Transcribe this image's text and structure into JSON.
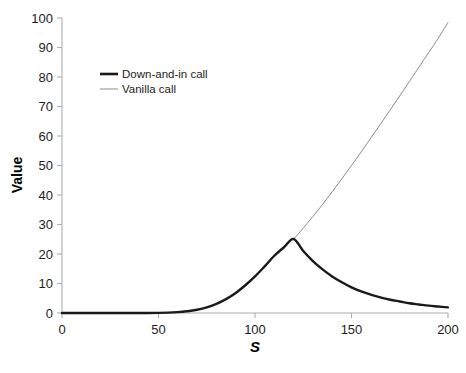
{
  "chart_data": {
    "type": "line",
    "title": "",
    "xlabel": "S",
    "ylabel": "Value",
    "xlim": [
      0,
      200
    ],
    "ylim": [
      0,
      100
    ],
    "xticks": [
      0,
      50,
      100,
      150,
      200
    ],
    "yticks": [
      0,
      10,
      20,
      30,
      40,
      50,
      60,
      70,
      80,
      90,
      100
    ],
    "xtick_labels": [
      "0",
      "50",
      "100",
      "150",
      "200"
    ],
    "ytick_labels": [
      "0",
      "10",
      "20",
      "30",
      "40",
      "50",
      "60",
      "70",
      "80",
      "90",
      "100"
    ],
    "grid": false,
    "legend_position": "upper-left-inside",
    "barrier_level": 120,
    "barrier_value": 25,
    "series": [
      {
        "name": "Down-and-in call",
        "color": "#1a1a1a",
        "line_width": 2.4,
        "x": [
          0,
          10,
          20,
          30,
          40,
          50,
          60,
          65,
          70,
          75,
          80,
          85,
          90,
          95,
          100,
          105,
          110,
          115,
          120,
          125,
          130,
          135,
          140,
          145,
          150,
          155,
          160,
          165,
          170,
          175,
          180,
          185,
          190,
          195,
          200
        ],
        "values": [
          0,
          0,
          0,
          0,
          0,
          0.05,
          0.3,
          0.6,
          1.1,
          1.9,
          3.1,
          4.7,
          6.8,
          9.4,
          12.4,
          15.8,
          19.4,
          22.3,
          25.1,
          21.0,
          17.6,
          14.8,
          12.4,
          10.4,
          8.7,
          7.3,
          6.2,
          5.3,
          4.5,
          3.9,
          3.3,
          2.9,
          2.5,
          2.2,
          1.9
        ]
      },
      {
        "name": "Vanilla call",
        "color": "#8c8c8c",
        "line_width": 1.0,
        "x": [
          0,
          10,
          20,
          30,
          40,
          50,
          60,
          65,
          70,
          75,
          80,
          85,
          90,
          95,
          100,
          105,
          110,
          115,
          120,
          125,
          130,
          135,
          140,
          145,
          150,
          155,
          160,
          165,
          170,
          175,
          180,
          185,
          190,
          195,
          200
        ],
        "values": [
          0,
          0,
          0,
          0,
          0,
          0.05,
          0.3,
          0.6,
          1.1,
          1.9,
          3.1,
          4.7,
          6.8,
          9.4,
          12.4,
          15.8,
          19.4,
          22.3,
          25.1,
          28.8,
          32.7,
          36.8,
          41.1,
          45.5,
          50.0,
          54.6,
          59.3,
          64.0,
          68.8,
          73.6,
          78.5,
          83.4,
          88.3,
          93.2,
          98.5
        ]
      }
    ],
    "legend": [
      {
        "label": "Down-and-in call",
        "color": "#1a1a1a",
        "line_width": 2.6
      },
      {
        "label": "Vanilla call",
        "color": "#8c8c8c",
        "line_width": 1.0
      }
    ],
    "axis_color": "#aeaeae"
  },
  "caption": {
    "text": ""
  }
}
